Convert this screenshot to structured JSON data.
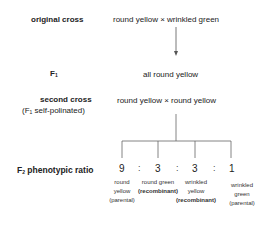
{
  "rows": {
    "original_cross": {
      "label": "original cross",
      "content": "round yellow × wrinkled green"
    },
    "f1": {
      "label_main": "F",
      "label_sub": "1",
      "content": "all round yellow"
    },
    "second_cross": {
      "label": "second cross",
      "sublabel_pre": "(F",
      "sublabel_sub": "1",
      "sublabel_post": " self-polinated)",
      "content": "round yellow × round yellow"
    },
    "f2": {
      "label_main": "F",
      "label_sub": "2",
      "label_post": " phenotypic ratio"
    }
  },
  "ratio": {
    "separator": ":",
    "outcomes": [
      {
        "value": "9",
        "lines": [
          "round",
          "yellow",
          "(parental)"
        ],
        "bold_line": -1
      },
      {
        "value": "3",
        "lines": [
          "round green",
          "(recombinant)"
        ],
        "bold_line": 1
      },
      {
        "value": "3",
        "lines": [
          "wrinkled",
          "yellow",
          "(recombinant)"
        ],
        "bold_line": 2
      },
      {
        "value": "1",
        "lines": [
          "wrinkled",
          "green",
          "(parental)"
        ],
        "bold_line": -1
      }
    ]
  },
  "colors": {
    "text": "#222222",
    "lines": "#555555",
    "background": "#ffffff"
  }
}
